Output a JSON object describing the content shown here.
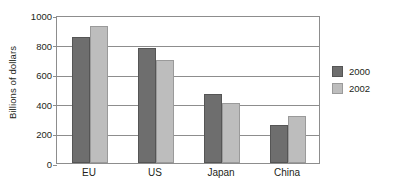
{
  "chart_data": {
    "type": "bar",
    "title": "",
    "xlabel": "",
    "ylabel": "Billions of dollars",
    "categories": [
      "EU",
      "US",
      "Japan",
      "China"
    ],
    "series": [
      {
        "name": "2000",
        "color": "#6e6e6e",
        "values": [
          850,
          780,
          465,
          260
        ]
      },
      {
        "name": "2002",
        "color": "#bdbdbd",
        "values": [
          925,
          695,
          405,
          315
        ]
      }
    ],
    "ylim": [
      0,
      1000
    ],
    "yticks": [
      0,
      200,
      400,
      600,
      800,
      1000
    ],
    "ytick_labels": [
      "0",
      "200",
      "400",
      "600",
      "800",
      "1000"
    ],
    "grid": true,
    "legend_position": "right",
    "legend_entries": [
      "2000",
      "2002"
    ]
  }
}
